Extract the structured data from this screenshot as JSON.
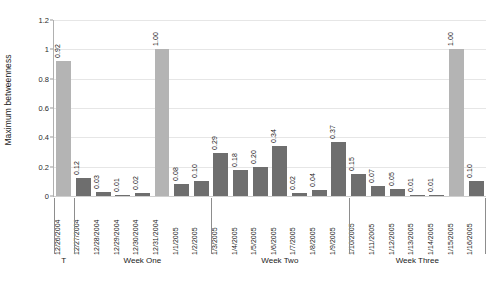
{
  "chart_data": {
    "type": "bar",
    "title": "",
    "xlabel": "",
    "ylabel": "Maximum betweenness",
    "ylim": [
      0,
      1.2
    ],
    "ytick_values": [
      0,
      0.2,
      0.4,
      0.6,
      0.8,
      1,
      1.2
    ],
    "ytick_labels": [
      "0",
      "0.2",
      "0.4",
      "0.6",
      "0.8",
      "1",
      "1.2"
    ],
    "grid": true,
    "legend": "none",
    "categories": [
      "12/26/2004",
      "12/27/2004",
      "12/28/2004",
      "12/29/2004",
      "12/30/2004",
      "12/31/2004",
      "1/1/2005",
      "1/2/2005",
      "1/3/2005",
      "1/4/2005",
      "1/5/2005",
      "1/6/2005",
      "1/7/2005",
      "1/8/2005",
      "1/9/2005",
      "1/10/2005",
      "1/11/2005",
      "1/12/2005",
      "1/13/2005",
      "1/14/2005",
      "1/15/2005",
      "1/16/2005"
    ],
    "values": [
      0.92,
      0.12,
      0.03,
      0.01,
      0.02,
      1.0,
      0.08,
      0.1,
      0.29,
      0.18,
      0.2,
      0.34,
      0.02,
      0.04,
      0.37,
      0.15,
      0.07,
      0.05,
      0.01,
      0.01,
      1.0,
      0.1
    ],
    "value_labels": [
      "0.92",
      "0.12",
      "0.03",
      "0.01",
      "0.02",
      "1.00",
      "0.08",
      "0.10",
      "0.29",
      "0.18",
      "0.20",
      "0.34",
      "0.02",
      "0.04",
      "0.37",
      "0.15",
      "0.07",
      "0.05",
      "0.01",
      "0.01",
      "1.00",
      "0.10"
    ],
    "bar_styles": [
      "light",
      "dark",
      "dark",
      "dark",
      "dark",
      "light",
      "dark",
      "dark",
      "dark",
      "dark",
      "dark",
      "dark",
      "dark",
      "dark",
      "dark",
      "dark",
      "dark",
      "dark",
      "dark",
      "dark",
      "light",
      "dark"
    ],
    "colors": {
      "light_bar": "#b4b4b4",
      "dark_bar": "#6e6e6e",
      "gridline": "#e6e6e6",
      "axis": "#b0b0b0",
      "text": "#1a1a1a"
    },
    "groups": [
      {
        "label": "T",
        "start_index": 0,
        "end_index": 0
      },
      {
        "label": "Week One",
        "start_index": 1,
        "end_index": 7
      },
      {
        "label": "Week Two",
        "start_index": 8,
        "end_index": 14
      },
      {
        "label": "Week Three",
        "start_index": 15,
        "end_index": 21
      }
    ]
  }
}
